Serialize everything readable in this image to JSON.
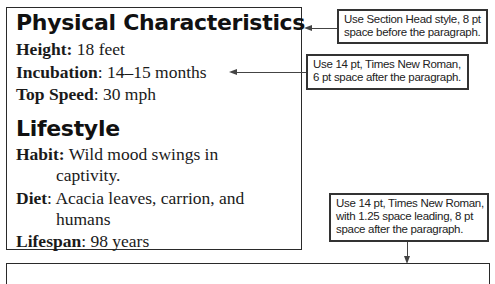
{
  "document": {
    "sections": [
      {
        "heading": "Physical Characteristics",
        "fields": [
          {
            "label": "Height:",
            "value": " 18 feet"
          },
          {
            "label": "Incubation",
            "value": ": 14–15 months"
          },
          {
            "label": "Top Speed",
            "value": ": 30 mph"
          }
        ]
      },
      {
        "heading": "Lifestyle",
        "fields": [
          {
            "label": "Habit:",
            "value": " Wild mood swings in",
            "continuation": "captivity."
          },
          {
            "label": "Diet",
            "value": ": Acacia leaves, carrion, and",
            "continuation": "humans"
          },
          {
            "label": "Lifespan",
            "value": ": 98 years"
          }
        ]
      }
    ]
  },
  "callouts": [
    {
      "lines": [
        "Use Section Head style, 8 pt",
        "space before the paragraph."
      ]
    },
    {
      "lines": [
        "Use 14 pt, Times New Roman,",
        "6 pt space after the paragraph."
      ]
    },
    {
      "lines": [
        "Use 14 pt, Times New Roman,",
        "with 1.25 space leading, 8 pt",
        "space after the paragraph."
      ]
    }
  ]
}
